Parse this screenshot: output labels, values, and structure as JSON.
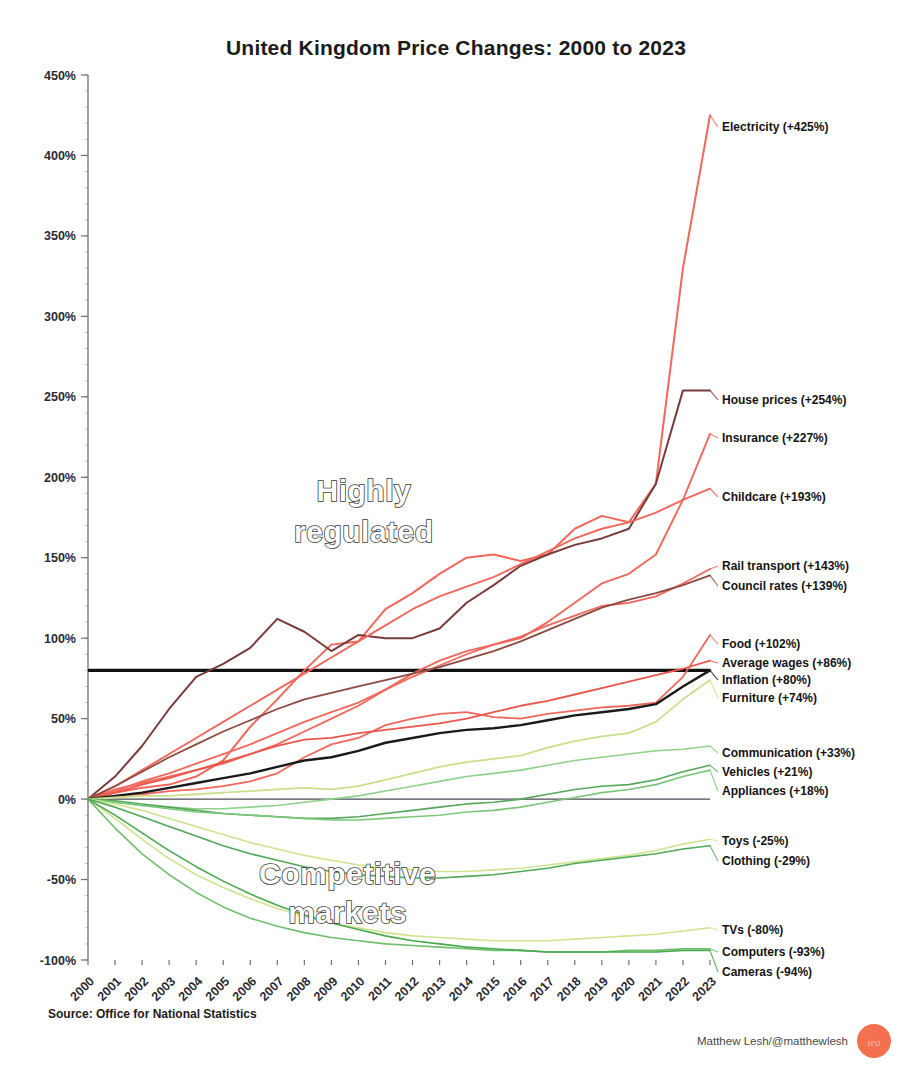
{
  "chart_data": {
    "type": "line",
    "title": "United Kingdom Price Changes: 2000 to 2023",
    "xlabel": "",
    "ylabel": "",
    "ylim": [
      -100,
      450
    ],
    "xlim": [
      2000,
      2023
    ],
    "grid": false,
    "legend_position": "right-inline-labels",
    "ytick_values": [
      -100,
      -50,
      0,
      50,
      100,
      150,
      200,
      250,
      300,
      350,
      400,
      450
    ],
    "ytick_labels": [
      "-100%",
      "-50%",
      "0%",
      "50%",
      "100%",
      "150%",
      "200%",
      "250%",
      "300%",
      "350%",
      "400%",
      "450%"
    ],
    "x": [
      2000,
      2001,
      2002,
      2003,
      2004,
      2005,
      2006,
      2007,
      2008,
      2009,
      2010,
      2011,
      2012,
      2013,
      2014,
      2015,
      2016,
      2017,
      2018,
      2019,
      2020,
      2021,
      2022,
      2023
    ],
    "xtick_labels": [
      "2000",
      "2001",
      "2002",
      "2003",
      "2004",
      "2005",
      "2006",
      "2007",
      "2008",
      "2009",
      "2010",
      "2011",
      "2012",
      "2013",
      "2014",
      "2015",
      "2016",
      "2017",
      "2018",
      "2019",
      "2020",
      "2021",
      "2022",
      "2023"
    ],
    "annotations": [
      {
        "text": "Highly",
        "x": 2010.2,
        "y": 185,
        "name": "highly-regulated-annotation-line1"
      },
      {
        "text": "regulated",
        "x": 2010.2,
        "y": 160,
        "name": "highly-regulated-annotation-line2"
      },
      {
        "text": "Competitive",
        "x": 2009.6,
        "y": -53,
        "name": "competitive-markets-annotation-line1"
      },
      {
        "text": "markets",
        "x": 2009.6,
        "y": -77,
        "name": "competitive-markets-annotation-line2"
      }
    ],
    "series": [
      {
        "name": "Electricity",
        "label": "Electricity (+425%)",
        "final_value": 425,
        "color": "#f0675c",
        "width": 2.0,
        "label_y": 127,
        "values": [
          0,
          4,
          7,
          9,
          14,
          24,
          45,
          62,
          80,
          96,
          98,
          118,
          128,
          140,
          150,
          152,
          148,
          152,
          168,
          176,
          172,
          196,
          330,
          425
        ]
      },
      {
        "name": "House prices",
        "label": "House prices (+254%)",
        "final_value": 254,
        "color": "#7a3b3b",
        "width": 2.0,
        "label_y": 400,
        "values": [
          0,
          14,
          33,
          56,
          76,
          84,
          94,
          112,
          104,
          92,
          102,
          100,
          100,
          106,
          122,
          133,
          145,
          152,
          158,
          162,
          168,
          196,
          254,
          254
        ]
      },
      {
        "name": "Insurance",
        "label": "Insurance (+227%)",
        "final_value": 227,
        "color": "#f0675c",
        "width": 1.9,
        "label_y": 438,
        "values": [
          0,
          6,
          10,
          14,
          18,
          22,
          28,
          34,
          42,
          50,
          58,
          68,
          78,
          86,
          92,
          96,
          100,
          110,
          122,
          134,
          140,
          152,
          186,
          227
        ]
      },
      {
        "name": "Childcare",
        "label": "Childcare (+193%)",
        "final_value": 193,
        "color": "#f0675c",
        "width": 1.9,
        "label_y": 497,
        "values": [
          0,
          8,
          18,
          28,
          38,
          48,
          58,
          68,
          78,
          88,
          98,
          108,
          118,
          126,
          132,
          138,
          146,
          154,
          162,
          168,
          172,
          178,
          186,
          193
        ]
      },
      {
        "name": "Rail transport",
        "label": "Rail transport (+143%)",
        "final_value": 143,
        "color": "#f0675c",
        "width": 1.8,
        "label_y": 566,
        "values": [
          0,
          5,
          11,
          16,
          22,
          28,
          34,
          41,
          48,
          54,
          60,
          68,
          76,
          83,
          90,
          96,
          101,
          108,
          114,
          120,
          122,
          126,
          134,
          143
        ]
      },
      {
        "name": "Council rates",
        "label": "Council rates (+139%)",
        "final_value": 139,
        "color": "#8d4a40",
        "width": 1.8,
        "label_y": 586,
        "values": [
          0,
          8,
          17,
          26,
          34,
          42,
          49,
          56,
          62,
          66,
          70,
          74,
          78,
          82,
          87,
          92,
          98,
          105,
          112,
          119,
          124,
          128,
          133,
          139
        ]
      },
      {
        "name": "Food",
        "label": "Food (+102%)",
        "final_value": 102,
        "color": "#f0675c",
        "width": 1.8,
        "label_y": 644,
        "values": [
          0,
          2,
          3,
          5,
          6,
          8,
          11,
          16,
          26,
          34,
          38,
          46,
          50,
          53,
          54,
          51,
          50,
          53,
          55,
          57,
          58,
          60,
          76,
          102
        ]
      },
      {
        "name": "Average wages",
        "label": "Average wages (+86%)",
        "final_value": 86,
        "color": "#e8574b",
        "width": 1.8,
        "label_y": 663,
        "values": [
          0,
          4,
          9,
          13,
          18,
          23,
          28,
          33,
          37,
          38,
          41,
          43,
          45,
          47,
          50,
          54,
          58,
          61,
          65,
          69,
          73,
          77,
          81,
          86
        ]
      },
      {
        "name": "Inflation",
        "label": "Inflation (+80%)",
        "final_value": 80,
        "color": "#1a1a1a",
        "width": 2.4,
        "label_y": 680,
        "values": [
          0,
          2,
          4,
          7,
          10,
          13,
          16,
          20,
          24,
          26,
          30,
          35,
          38,
          41,
          43,
          44,
          46,
          49,
          52,
          54,
          56,
          59,
          70,
          80
        ]
      },
      {
        "name": "Furniture",
        "label": "Furniture (+74%)",
        "final_value": 74,
        "color": "#c9e08a",
        "width": 1.8,
        "label_y": 698,
        "values": [
          0,
          1,
          2,
          2,
          3,
          4,
          5,
          6,
          7,
          6,
          8,
          12,
          16,
          20,
          23,
          25,
          27,
          32,
          36,
          39,
          41,
          48,
          62,
          74
        ]
      },
      {
        "name": "Communication",
        "label": "Communication (+33%)",
        "final_value": 33,
        "color": "#8fd18a",
        "width": 1.6,
        "label_y": 753,
        "values": [
          0,
          -2,
          -4,
          -5,
          -6,
          -6,
          -5,
          -4,
          -2,
          0,
          2,
          5,
          8,
          11,
          14,
          16,
          18,
          21,
          24,
          26,
          28,
          30,
          31,
          33
        ]
      },
      {
        "name": "Vehicles",
        "label": "Vehicles (+21%)",
        "final_value": 21,
        "color": "#57a85a",
        "width": 1.6,
        "label_y": 772,
        "values": [
          0,
          -1,
          -3,
          -5,
          -7,
          -9,
          -10,
          -11,
          -12,
          -12,
          -11,
          -9,
          -7,
          -5,
          -3,
          -2,
          0,
          3,
          6,
          8,
          9,
          12,
          17,
          21
        ]
      },
      {
        "name": "Appliances",
        "label": "Appliances (+18%)",
        "final_value": 18,
        "color": "#7bc77a",
        "width": 1.6,
        "label_y": 791,
        "values": [
          0,
          -2,
          -4,
          -6,
          -8,
          -9,
          -10,
          -11,
          -12,
          -13,
          -13,
          -12,
          -11,
          -10,
          -8,
          -7,
          -5,
          -2,
          1,
          4,
          6,
          9,
          14,
          18
        ]
      },
      {
        "name": "Toys",
        "label": "Toys (-25%)",
        "final_value": -25,
        "color": "#cfe48e",
        "width": 1.6,
        "label_y": 841,
        "values": [
          0,
          -3,
          -7,
          -12,
          -17,
          -22,
          -27,
          -31,
          -35,
          -38,
          -41,
          -43,
          -44,
          -45,
          -45,
          -44,
          -43,
          -41,
          -39,
          -37,
          -35,
          -32,
          -28,
          -25
        ]
      },
      {
        "name": "Clothing",
        "label": "Clothing (-29%)",
        "final_value": -29,
        "color": "#4fa857",
        "width": 1.6,
        "label_y": 861,
        "values": [
          0,
          -5,
          -11,
          -17,
          -23,
          -29,
          -34,
          -38,
          -42,
          -45,
          -47,
          -48,
          -49,
          -49,
          -48,
          -47,
          -45,
          -43,
          -40,
          -38,
          -36,
          -34,
          -31,
          -29
        ]
      },
      {
        "name": "TVs",
        "label": "TVs (-80%)",
        "final_value": -80,
        "color": "#cfe48e",
        "width": 1.6,
        "label_y": 930,
        "values": [
          0,
          -12,
          -25,
          -37,
          -47,
          -55,
          -62,
          -68,
          -73,
          -77,
          -80,
          -83,
          -85,
          -86,
          -87,
          -88,
          -88,
          -88,
          -87,
          -86,
          -85,
          -84,
          -82,
          -80
        ]
      },
      {
        "name": "Computers",
        "label": "Computers (-93%)",
        "final_value": -93,
        "color": "#6fbf6d",
        "width": 1.6,
        "label_y": 952,
        "values": [
          0,
          -18,
          -34,
          -47,
          -58,
          -67,
          -74,
          -79,
          -83,
          -86,
          -88,
          -90,
          -91,
          -92,
          -93,
          -94,
          -94,
          -95,
          -95,
          -95,
          -94,
          -94,
          -93,
          -93
        ]
      },
      {
        "name": "Cameras",
        "label": "Cameras (-94%)",
        "final_value": -94,
        "color": "#4aa84e",
        "width": 1.6,
        "label_y": 972,
        "values": [
          0,
          -10,
          -21,
          -32,
          -42,
          -51,
          -59,
          -66,
          -72,
          -77,
          -81,
          -85,
          -88,
          -90,
          -92,
          -93,
          -94,
          -95,
          -95,
          -95,
          -95,
          -95,
          -94,
          -94
        ]
      }
    ],
    "reference_lines": [
      {
        "name": "inflation-reference-line",
        "y": 80,
        "x_from": 2000,
        "x_to": 2023,
        "color": "#111111",
        "width": 3.2
      },
      {
        "name": "zero-reference-line",
        "y": 0,
        "x_from": 2000,
        "x_to": 2023,
        "color": "#4a4a55",
        "width": 1.1
      }
    ]
  },
  "footer": {
    "source": "Source: Office for National Statistics",
    "credit": "Matthew Lesh/@matthewlesh",
    "logo_text": "iea",
    "logo_color": "#f4704f"
  }
}
